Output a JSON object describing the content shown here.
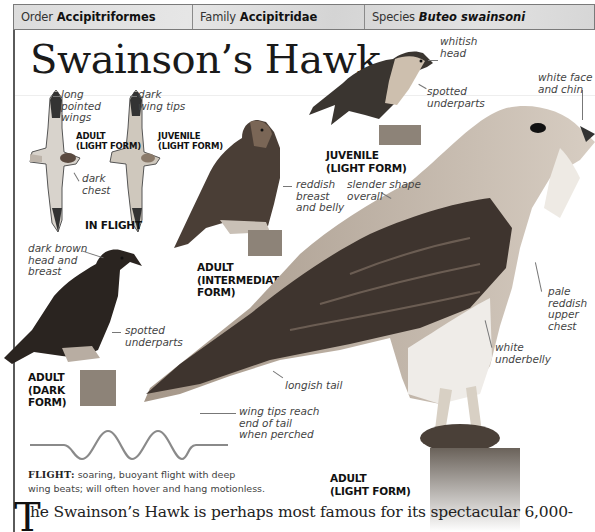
{
  "taxonomy": {
    "order_label": "Order",
    "order_value": "Accipitriformes",
    "family_label": "Family",
    "family_value": "Accipitridae",
    "species_label": "Species",
    "species_value": "Buteo swainsoni"
  },
  "title": "Swainson’s Hawk",
  "in_flight": {
    "caption": "IN FLIGHT",
    "adult_light": {
      "caption_line1": "ADULT",
      "caption_line2": "(LIGHT FORM)"
    },
    "juvenile_light": {
      "caption_line1": "JUVENILE",
      "caption_line2": "(LIGHT FORM)"
    },
    "annotations": {
      "long_pointed_wings": [
        "long",
        "pointed",
        "wings"
      ],
      "dark_wing_tips": [
        "dark",
        "wing tips"
      ],
      "dark_chest": [
        "dark",
        "chest"
      ]
    }
  },
  "perched_juvenile": {
    "caption_line1": "JUVENILE",
    "caption_line2": "(LIGHT FORM)",
    "annotations": {
      "whitish_head": [
        "whitish",
        "head"
      ],
      "spotted_underparts": [
        "spotted",
        "underparts"
      ]
    }
  },
  "adult_intermediate": {
    "caption_lines": [
      "ADULT",
      "(INTERMEDIATE",
      "FORM)"
    ],
    "annotations": {
      "reddish_breast": [
        "reddish",
        "breast",
        "and belly"
      ]
    }
  },
  "adult_dark": {
    "caption_lines": [
      "ADULT",
      "(DARK",
      "FORM)"
    ],
    "annotations": {
      "dark_brown_head": [
        "dark brown",
        "head and",
        "breast"
      ],
      "spotted_underparts": [
        "spotted",
        "underparts"
      ]
    }
  },
  "adult_light": {
    "caption_lines": [
      "ADULT",
      "(LIGHT FORM)"
    ],
    "annotations": {
      "white_face": [
        "white face",
        "and chin"
      ],
      "slender_shape": [
        "slender shape",
        "overall"
      ],
      "pale_reddish": [
        "pale",
        "reddish",
        "upper",
        "chest"
      ],
      "white_underbelly": [
        "white",
        "underbelly"
      ],
      "longish_tail": [
        "longish tail"
      ],
      "wing_tips_reach": [
        "wing tips reach",
        "end of tail",
        "when perched"
      ]
    }
  },
  "flight_note": {
    "label": "FLIGHT:",
    "text_line1": "soaring, buoyant flight with deep",
    "text_line2": "wing beats; will often hover and hang motionless."
  },
  "body": {
    "dropcap": "T",
    "first_line": "he Swainson’s Hawk is perhaps most famous for its spectacular 6,000-"
  },
  "colors": {
    "taxo_bar": "#dcdcdc",
    "border": "#5a5a5a",
    "annotation_text": "#444444",
    "wave": "#8a8a8a"
  }
}
